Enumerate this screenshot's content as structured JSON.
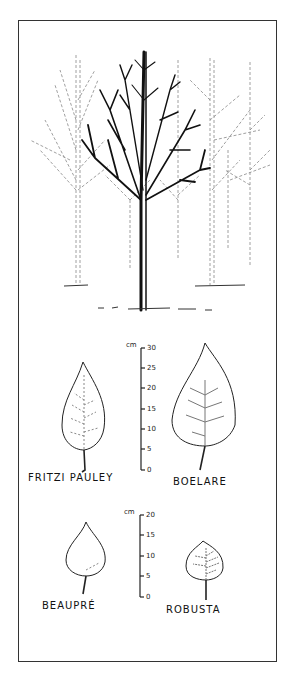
{
  "figure": {
    "ink_color": "#1a1a1a",
    "faint_color": "#777777"
  },
  "scales": [
    {
      "unit": "cm",
      "ticks": [
        "30",
        "25",
        "20",
        "15",
        "10",
        "5",
        "0"
      ]
    },
    {
      "unit": "cm",
      "ticks": [
        "20",
        "15",
        "10",
        "5",
        "0"
      ]
    }
  ],
  "leaves": [
    {
      "name": "FRITZI PAULEY",
      "approx_length_cm": 26
    },
    {
      "name": "BOELARE",
      "approx_length_cm": 31
    },
    {
      "name": "BEAUPRÉ",
      "approx_length_cm": 17
    },
    {
      "name": "ROBUSTA",
      "approx_length_cm": 13
    }
  ]
}
